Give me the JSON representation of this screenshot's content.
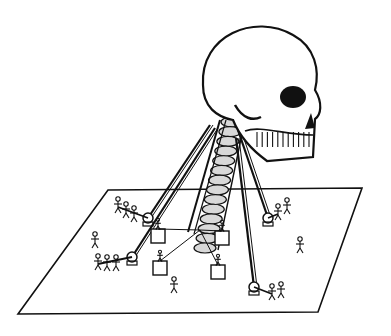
{
  "illustration": {
    "subject": "giant skull suspended above a flat platform by its spine, pulled by ropes held by stick figures",
    "colors": {
      "ink": "#111111",
      "paper": "#ffffff",
      "shade": "#d8d8d8"
    },
    "platform": {
      "points": "108,190 362,188 318,312 18,314"
    },
    "skull": {
      "cx": 265,
      "cy": 95
    },
    "rope_teams": [
      {
        "pulley": [
          148,
          218
        ],
        "anchor": [
          210,
          125
        ],
        "figures": [
          [
            118,
            205
          ],
          [
            126,
            210
          ],
          [
            134,
            214
          ]
        ]
      },
      {
        "pulley": [
          132,
          257
        ],
        "anchor": [
          215,
          128
        ],
        "figures": [
          [
            98,
            262
          ],
          [
            107,
            263
          ],
          [
            116,
            263
          ]
        ]
      },
      {
        "pulley": [
          268,
          218
        ],
        "anchor": [
          238,
          130
        ],
        "figures": [
          [
            278,
            212
          ],
          [
            287,
            206
          ]
        ]
      },
      {
        "pulley": [
          254,
          287
        ],
        "anchor": [
          236,
          138
        ],
        "figures": [
          [
            272,
            292
          ],
          [
            281,
            290
          ]
        ]
      }
    ],
    "boxes": [
      [
        158,
        236
      ],
      [
        222,
        238
      ],
      [
        160,
        268
      ],
      [
        218,
        272
      ]
    ],
    "walkers": [
      [
        95,
        240
      ],
      [
        300,
        245
      ],
      [
        174,
        285
      ]
    ]
  }
}
